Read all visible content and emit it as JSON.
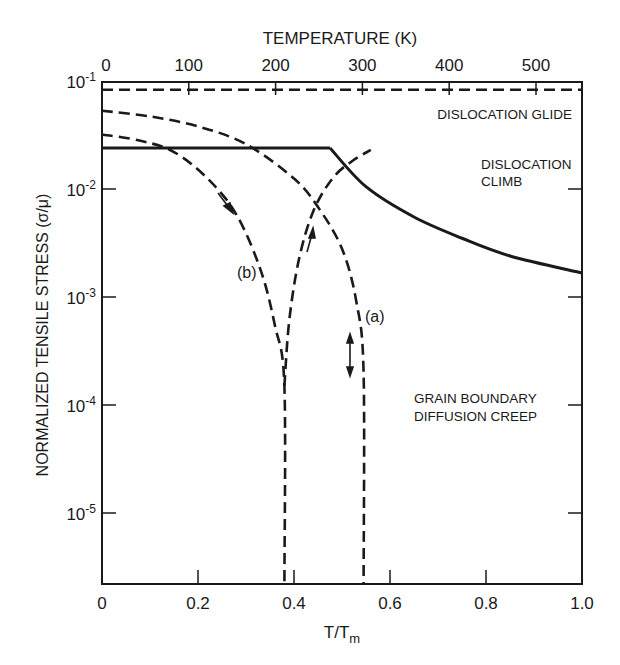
{
  "chart_data": {
    "type": "line",
    "title": "",
    "top_axis": {
      "label": "TEMPERATURE (K)",
      "ticks": [
        "0",
        "100",
        "200",
        "300",
        "400",
        "500"
      ],
      "tick_values": [
        0,
        100,
        200,
        300,
        400,
        500
      ]
    },
    "xlabel": "T/T",
    "xlabel_sub": "m",
    "xlim": [
      0,
      1.0
    ],
    "xticks": [
      "0",
      "0.2",
      "0.4",
      "0.6",
      "0.8",
      "1.0"
    ],
    "xtick_values": [
      0,
      0.2,
      0.4,
      0.6,
      0.8,
      1.0
    ],
    "ylabel": "NORMALIZED TENSILE STRESS (σ/μ)",
    "yscale": "log",
    "ylim": [
      2.2e-06,
      0.1
    ],
    "yticks": [
      {
        "base": "10",
        "exp": "-1",
        "value": 0.1
      },
      {
        "base": "10",
        "exp": "-2",
        "value": 0.01
      },
      {
        "base": "10",
        "exp": "-3",
        "value": 0.001
      },
      {
        "base": "10",
        "exp": "-4",
        "value": 0.0001
      },
      {
        "base": "10",
        "exp": "-5",
        "value": 1e-05
      }
    ],
    "grid": false,
    "regions": [
      {
        "label": "DISLOCATION GLIDE",
        "lines": [
          "DISLOCATION GLIDE"
        ]
      },
      {
        "label": "DISLOCATION CLIMB",
        "lines": [
          "DISLOCATION",
          "CLIMB"
        ]
      },
      {
        "label": "GRAIN BOUNDARY DIFFUSION CREEP",
        "lines": [
          "GRAIN BOUNDARY",
          "DIFFUSION CREEP"
        ]
      }
    ],
    "series": [
      {
        "name": "glide boundary",
        "style": "dashed",
        "x": [
          0,
          1.0
        ],
        "y": [
          0.083,
          0.083
        ]
      },
      {
        "name": "glide/climb boundary",
        "style": "solid",
        "x": [
          0,
          0.475
        ],
        "y": [
          0.024,
          0.024
        ]
      },
      {
        "name": "climb/diffusion boundary",
        "style": "solid",
        "x": [
          0.475,
          0.55,
          0.65,
          0.75,
          0.85,
          1.0
        ],
        "y": [
          0.024,
          0.0105,
          0.0055,
          0.0035,
          0.0024,
          0.00167
        ]
      },
      {
        "name": "(a)",
        "style": "dashed",
        "x": [
          0,
          0.1,
          0.2,
          0.3,
          0.4,
          0.45,
          0.5,
          0.53,
          0.545,
          0.545
        ],
        "y": [
          0.053,
          0.047,
          0.038,
          0.026,
          0.0125,
          0.0068,
          0.0028,
          0.0009,
          0.0002,
          2.2e-06
        ]
      },
      {
        "name": "(b)",
        "style": "dashed",
        "x": [
          0,
          0.08,
          0.15,
          0.22,
          0.28,
          0.33,
          0.36,
          0.38,
          0.38
        ],
        "y": [
          0.032,
          0.028,
          0.022,
          0.0125,
          0.0058,
          0.0018,
          0.00055,
          0.00015,
          2.2e-06
        ]
      },
      {
        "name": "(b) return",
        "style": "dashed",
        "x": [
          0.38,
          0.39,
          0.41,
          0.44,
          0.48,
          0.52,
          0.56
        ],
        "y": [
          0.00015,
          0.0006,
          0.0022,
          0.0062,
          0.0125,
          0.018,
          0.023
        ]
      }
    ],
    "annotations": [
      {
        "text": "(a)",
        "x": 0.56,
        "y": 0.0011
      },
      {
        "text": "(b)",
        "x": 0.31,
        "y": 0.0021
      },
      {
        "text": "arrow-down",
        "x": 0.22,
        "y": 0.007
      },
      {
        "text": "arrow-up",
        "x": 0.43,
        "y": 0.004
      },
      {
        "text": "double-arrow",
        "x": 0.52,
        "y": 0.00025
      }
    ]
  },
  "labels": {
    "top_axis_title": "TEMPERATURE (K)",
    "x_title_main": "T/T",
    "x_title_sub": "m",
    "y_title": "NORMALIZED TENSILE STRESS (σ/μ)",
    "region_glide": "DISLOCATION GLIDE",
    "region_climb_1": "DISLOCATION",
    "region_climb_2": "CLIMB",
    "region_gb_1": "GRAIN BOUNDARY",
    "region_gb_2": "DIFFUSION CREEP",
    "curve_a": "(a)",
    "curve_b": "(b)"
  }
}
